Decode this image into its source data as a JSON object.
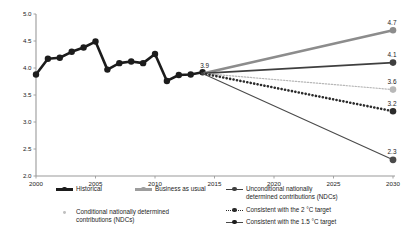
{
  "chart_data": {
    "type": "line",
    "title": "",
    "xlabel": "",
    "ylabel": "",
    "xlim": [
      2000,
      2030
    ],
    "ylim": [
      2.0,
      5.0
    ],
    "grid": false,
    "legend_position": "bottom",
    "xticks": [
      "2000",
      "2005",
      "2010",
      "2015",
      "2020",
      "2025",
      "2030"
    ],
    "yticks": [
      "5.0",
      "4.5",
      "4.0",
      "3.5",
      "3.0",
      "2.5",
      "2.0"
    ],
    "branch_point": {
      "x": 2014,
      "y": 3.9,
      "label": "3.9"
    },
    "series": [
      {
        "name": "Historical",
        "style": "solid-thick-marker",
        "color": "#1c1c1c",
        "x": [
          2000,
          2001,
          2002,
          2003,
          2004,
          2005,
          2006,
          2007,
          2008,
          2009,
          2010,
          2011,
          2012,
          2013,
          2014
        ],
        "values": [
          3.88,
          4.17,
          4.19,
          4.3,
          4.38,
          4.49,
          3.97,
          4.09,
          4.12,
          4.09,
          4.26,
          3.76,
          3.87,
          3.88,
          3.92
        ],
        "end_label": ""
      },
      {
        "name": "Business as usual",
        "style": "solid-thick",
        "color": "#8c8c8c",
        "x": [
          2014,
          2030
        ],
        "values": [
          3.9,
          4.7
        ],
        "end_label": "4.7"
      },
      {
        "name": "Unconditional nationally determined contributions (NDCs)",
        "style": "solid-medium",
        "color": "#3f3f3f",
        "x": [
          2014,
          2030
        ],
        "values": [
          3.9,
          4.1
        ],
        "end_label": "4.1"
      },
      {
        "name": "Conditional nationally determined contributions (NDCs)",
        "style": "fine-dotted",
        "color": "#b8b8b8",
        "x": [
          2014,
          2030
        ],
        "values": [
          3.9,
          3.6
        ],
        "end_label": "3.6"
      },
      {
        "name": "Consistent with the 2 °C target",
        "style": "bold-dotted",
        "color": "#2b2b2b",
        "x": [
          2014,
          2030
        ],
        "values": [
          3.9,
          3.2
        ],
        "end_label": "3.2"
      },
      {
        "name": "Consistent with the 1.5 °C target",
        "style": "solid-thin",
        "color": "#4a4a4a",
        "x": [
          2014,
          2030
        ],
        "values": [
          3.9,
          2.3
        ],
        "end_label": "2.3"
      }
    ]
  },
  "legend": {
    "items": [
      {
        "id": "historical",
        "label": "Historical"
      },
      {
        "id": "business-as-usual",
        "label": "Business as usual"
      },
      {
        "id": "unconditional-ndc",
        "label": "Unconditional nationally\ndetermined contributions (NDCs)"
      },
      {
        "id": "conditional-ndc",
        "label": "Conditional nationally determined\ncontributions (NDCs)"
      },
      {
        "id": "target-2c",
        "label": "Consistent with the 2 °C target"
      },
      {
        "id": "target-1-5c",
        "label": "Consistent with the 1.5 °C target"
      }
    ]
  },
  "colors": {
    "historical": "#1c1c1c",
    "business_as_usual": "#8c8c8c",
    "unconditional_ndc": "#3f3f3f",
    "conditional_ndc": "#b8b8b8",
    "target_2c": "#2b2b2b",
    "target_1_5c": "#4a4a4a",
    "axis": "#9a9a9a",
    "background": "#ffffff"
  }
}
